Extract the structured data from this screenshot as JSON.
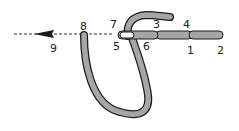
{
  "diagram": {
    "labels": [
      {
        "id": "1",
        "text": "1",
        "x": 187,
        "y": 54
      },
      {
        "id": "2",
        "text": "2",
        "x": 217,
        "y": 54
      },
      {
        "id": "3",
        "text": "3",
        "x": 153,
        "y": 28
      },
      {
        "id": "4",
        "text": "4",
        "x": 183,
        "y": 28
      },
      {
        "id": "5",
        "text": "5",
        "x": 113,
        "y": 50
      },
      {
        "id": "6",
        "text": "6",
        "x": 143,
        "y": 50
      },
      {
        "id": "7",
        "text": "7",
        "x": 110,
        "y": 28
      },
      {
        "id": "8",
        "text": "8",
        "x": 80,
        "y": 30
      },
      {
        "id": "9",
        "text": "9",
        "x": 50,
        "y": 52
      }
    ],
    "colors": {
      "thread": "#a6a6a6",
      "outline": "#1a1a1a",
      "guide": "#333333"
    }
  }
}
